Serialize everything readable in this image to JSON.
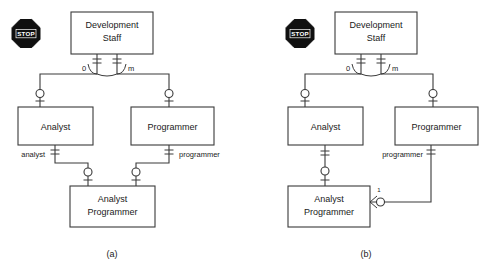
{
  "figure": {
    "caption_a": "(a)",
    "caption_b": "(b)",
    "background_color": "#ffffff",
    "line_color": "#3a3a3a",
    "text_color": "#1a1a1a",
    "stop_fill_color": "#101010",
    "stop_text_color": "#ffffff"
  },
  "icons": {
    "stop_sign_label": "STOP"
  },
  "diagram_a": {
    "caption": "(a)",
    "entities": [
      {
        "id": "dev_staff_a",
        "line1": "Development",
        "line2": "Staff"
      },
      {
        "id": "analyst_a",
        "line1": "Analyst",
        "line2": ""
      },
      {
        "id": "programmer_a",
        "line1": "Programmer",
        "line2": ""
      },
      {
        "id": "analyst_programmer_a",
        "line1": "Analyst",
        "line2": "Programmer"
      }
    ],
    "relationship_labels": [
      {
        "id": "label-zero-a",
        "text": "0"
      },
      {
        "id": "label-m-a",
        "text": "m"
      },
      {
        "id": "label-analyst-a",
        "text": "analyst"
      },
      {
        "id": "label-programmer-a",
        "text": "programmer"
      }
    ]
  },
  "diagram_b": {
    "caption": "(b)",
    "entities": [
      {
        "id": "dev_staff_b",
        "line1": "Development",
        "line2": "Staff"
      },
      {
        "id": "analyst_b",
        "line1": "Analyst",
        "line2": ""
      },
      {
        "id": "programmer_b",
        "line1": "Programmer",
        "line2": ""
      },
      {
        "id": "analyst_programmer_b",
        "line1": "Analyst",
        "line2": "Programmer"
      }
    ],
    "relationship_labels": [
      {
        "id": "label-zero-b",
        "text": "0"
      },
      {
        "id": "label-m-b",
        "text": "m"
      },
      {
        "id": "label-programmer-b",
        "text": "programmer"
      },
      {
        "id": "label-one-b",
        "text": "1"
      }
    ]
  }
}
